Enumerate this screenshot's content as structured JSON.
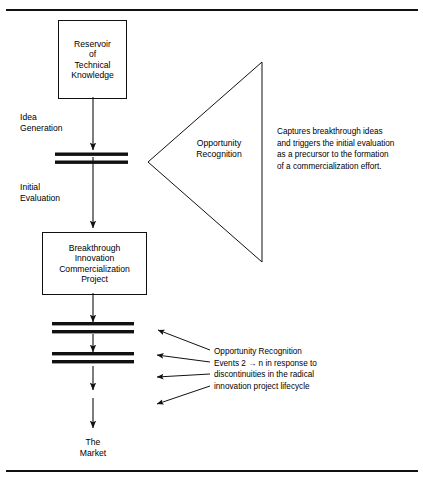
{
  "figure": {
    "type": "flow-diagram",
    "title": "",
    "top_rule": true,
    "bottom_rule": true
  },
  "nodes": {
    "reservoir": {
      "name": "reservoir-of-technical-knowledge",
      "lines": [
        "Reservoir",
        "of",
        "Technical",
        "Knowledge"
      ]
    },
    "project": {
      "name": "breakthrough-innovation-commercialization-project",
      "lines": [
        "Breakthrough",
        "Innovation",
        "Commercialization",
        "Project"
      ]
    },
    "market": {
      "name": "the-market",
      "lines": [
        "The",
        "Market"
      ]
    }
  },
  "stage_labels": [
    {
      "id": "idea-generation",
      "lines": [
        "Idea",
        "Generation"
      ]
    },
    {
      "id": "initial-evaluation",
      "lines": [
        "Initial",
        "Evaluation"
      ]
    }
  ],
  "triangle": {
    "name": "opportunity-recognition-triangle",
    "lines": [
      "Opportunity",
      "Recognition"
    ],
    "orientation": "points-left"
  },
  "notes": [
    {
      "id": "capture-note",
      "lines": [
        "Captures breakthrough ideas",
        "and triggers the initial evaluation",
        "as a precursor to the formation",
        "of a commercialization effort."
      ]
    },
    {
      "id": "recognition-events-note",
      "lines": [
        "Opportunity Recognition",
        "Events 2 → n in response to",
        "discontinuities in the radical",
        "innovation project lifecycle"
      ]
    }
  ],
  "gates": [
    {
      "id": "gate-1",
      "after": "idea-generation"
    },
    {
      "id": "gate-2",
      "after": "project"
    },
    {
      "id": "gate-3",
      "after": "gate-2"
    }
  ],
  "colors": {
    "ink": "#111111",
    "background": "#ffffff"
  }
}
